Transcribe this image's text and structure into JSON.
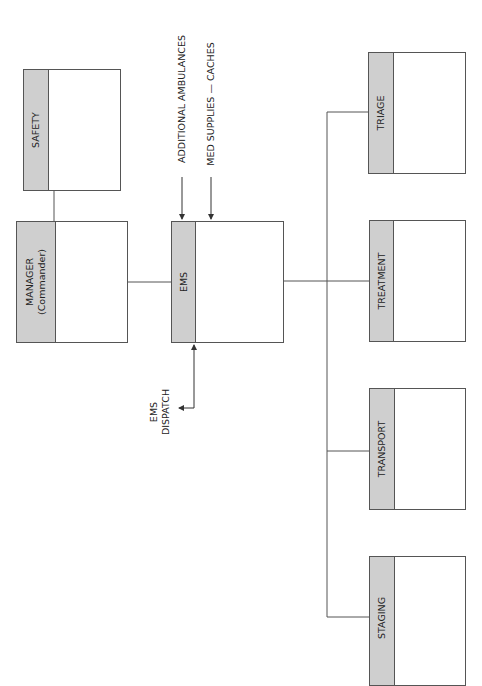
{
  "diagram": {
    "nodes": {
      "safety": {
        "label": "SAFETY"
      },
      "manager": {
        "label": "MANAGER",
        "sublabel": "(Commander)"
      },
      "ems": {
        "label": "EMS"
      },
      "triage": {
        "label": "TRIAGE"
      },
      "treatment": {
        "label": "TREATMENT"
      },
      "transport": {
        "label": "TRANSPORT"
      },
      "staging": {
        "label": "STAGING"
      }
    },
    "inputs": {
      "additional_ambulances": "ADDITIONAL AMBULANCES",
      "med_supplies": "MED SUPPLIES — CACHES"
    },
    "dispatch": {
      "line1": "EMS",
      "line2": "DISPATCH"
    },
    "edges": [
      {
        "from": "manager",
        "to": "safety"
      },
      {
        "from": "manager",
        "to": "ems"
      },
      {
        "from": "ems",
        "to": "triage"
      },
      {
        "from": "ems",
        "to": "treatment"
      },
      {
        "from": "ems",
        "to": "transport"
      },
      {
        "from": "ems",
        "to": "staging"
      },
      {
        "from": "additional_ambulances",
        "to": "ems",
        "arrow": "in"
      },
      {
        "from": "med_supplies",
        "to": "ems",
        "arrow": "in"
      },
      {
        "from": "ems",
        "to": "dispatch",
        "arrow": "both"
      }
    ],
    "colors": {
      "band": "#cfcfcf",
      "border": "#555555"
    }
  }
}
